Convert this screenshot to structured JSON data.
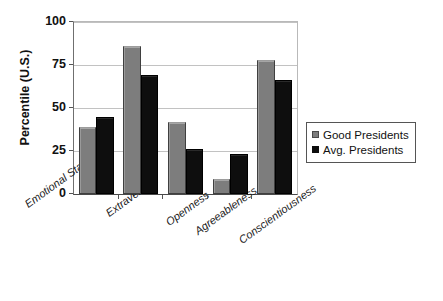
{
  "chart_data": {
    "type": "bar",
    "title": "",
    "xlabel": "",
    "ylabel": "Percentile (U.S.)",
    "ylim": [
      0,
      100
    ],
    "yticks": [
      0,
      25,
      50,
      75,
      100
    ],
    "ytick_labels": [
      "0",
      "25",
      "50",
      "75",
      "100"
    ],
    "grid": true,
    "legend_position": "right",
    "categories": [
      "Emotional Stability",
      "Extraversion",
      "Openness",
      "Agreeableness",
      "Conscientiousness"
    ],
    "series": [
      {
        "name": "Good Presidents",
        "color": "#7d7d7d",
        "values": [
          39,
          86,
          42,
          9,
          78
        ]
      },
      {
        "name": "Avg. Presidents",
        "color": "#0d0d0d",
        "values": [
          45,
          69,
          26,
          23,
          66
        ]
      }
    ]
  },
  "legend": {
    "items": [
      {
        "label": "Good Presidents",
        "swatch": "gray-square-icon"
      },
      {
        "label": "Avg. Presidents",
        "swatch": "black-square-icon"
      }
    ]
  }
}
